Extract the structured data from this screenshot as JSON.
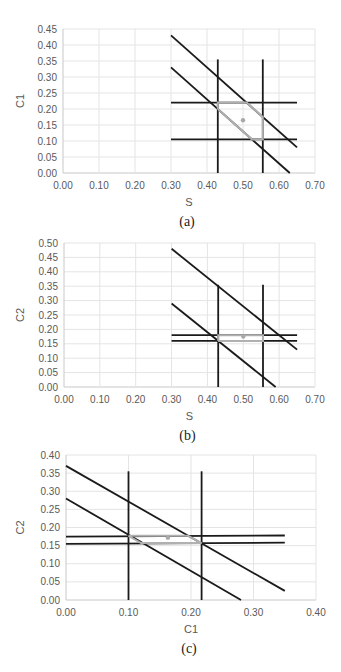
{
  "chart_data": [
    {
      "id": "a",
      "type": "line",
      "caption": "(a)",
      "xlabel": "S",
      "ylabel": "C1",
      "xlim": [
        0,
        0.7
      ],
      "ylim": [
        0,
        0.45
      ],
      "xticks": [
        "0.00",
        "0.10",
        "0.20",
        "0.30",
        "0.40",
        "0.50",
        "0.60",
        "0.70"
      ],
      "yticks": [
        "0.00",
        "0.05",
        "0.10",
        "0.15",
        "0.20",
        "0.25",
        "0.30",
        "0.35",
        "0.40",
        "0.45"
      ],
      "grid": true,
      "series": [
        {
          "name": "upper-diagonal",
          "color": "#1a1a1a",
          "points": [
            [
              0.3,
              0.43
            ],
            [
              0.65,
              0.08
            ]
          ]
        },
        {
          "name": "lower-diagonal",
          "color": "#1a1a1a",
          "points": [
            [
              0.3,
              0.33
            ],
            [
              0.63,
              0.0
            ]
          ]
        },
        {
          "name": "vertical-left",
          "color": "#1a1a1a",
          "points": [
            [
              0.43,
              0.0
            ],
            [
              0.43,
              0.355
            ]
          ]
        },
        {
          "name": "vertical-right",
          "color": "#1a1a1a",
          "points": [
            [
              0.555,
              0.0
            ],
            [
              0.555,
              0.355
            ]
          ]
        },
        {
          "name": "horizontal-top",
          "color": "#1a1a1a",
          "points": [
            [
              0.3,
              0.22
            ],
            [
              0.65,
              0.22
            ]
          ]
        },
        {
          "name": "horizontal-bottom",
          "color": "#1a1a1a",
          "points": [
            [
              0.3,
              0.105
            ],
            [
              0.65,
              0.105
            ]
          ]
        },
        {
          "name": "feasible-region",
          "color": "#b0b0b0",
          "points": [
            [
              0.43,
              0.2
            ],
            [
              0.43,
              0.22
            ],
            [
              0.51,
              0.22
            ],
            [
              0.555,
              0.175
            ],
            [
              0.555,
              0.105
            ],
            [
              0.525,
              0.105
            ],
            [
              0.43,
              0.2
            ]
          ]
        }
      ],
      "marker": {
        "x": 0.5,
        "y": 0.165,
        "color": "#a8a8a8"
      }
    },
    {
      "id": "b",
      "type": "line",
      "caption": "(b)",
      "xlabel": "S",
      "ylabel": "C2",
      "xlim": [
        0,
        0.7
      ],
      "ylim": [
        0,
        0.5
      ],
      "xticks": [
        "0.00",
        "0.10",
        "0.20",
        "0.30",
        "0.40",
        "0.50",
        "0.60",
        "0.70"
      ],
      "yticks": [
        "0.00",
        "0.05",
        "0.10",
        "0.15",
        "0.20",
        "0.25",
        "0.30",
        "0.35",
        "0.40",
        "0.45",
        "0.50"
      ],
      "grid": true,
      "series": [
        {
          "name": "upper-diagonal",
          "color": "#1a1a1a",
          "points": [
            [
              0.3,
              0.48
            ],
            [
              0.65,
              0.13
            ]
          ]
        },
        {
          "name": "lower-diagonal",
          "color": "#1a1a1a",
          "points": [
            [
              0.3,
              0.29
            ],
            [
              0.59,
              0.0
            ]
          ]
        },
        {
          "name": "vertical-left",
          "color": "#1a1a1a",
          "points": [
            [
              0.43,
              0.0
            ],
            [
              0.43,
              0.355
            ]
          ]
        },
        {
          "name": "vertical-right",
          "color": "#1a1a1a",
          "points": [
            [
              0.555,
              0.0
            ],
            [
              0.555,
              0.355
            ]
          ]
        },
        {
          "name": "horizontal-top",
          "color": "#1a1a1a",
          "points": [
            [
              0.3,
              0.18
            ],
            [
              0.65,
              0.18
            ]
          ]
        },
        {
          "name": "horizontal-bottom",
          "color": "#1a1a1a",
          "points": [
            [
              0.3,
              0.16
            ],
            [
              0.65,
              0.16
            ]
          ]
        },
        {
          "name": "feasible-region",
          "color": "#b0b0b0",
          "points": [
            [
              0.43,
              0.16
            ],
            [
              0.43,
              0.18
            ],
            [
              0.555,
              0.18
            ],
            [
              0.555,
              0.16
            ],
            [
              0.43,
              0.16
            ]
          ]
        }
      ],
      "marker": {
        "x": 0.5,
        "y": 0.175,
        "color": "#a8a8a8"
      }
    },
    {
      "id": "c",
      "type": "line",
      "caption": "(c)",
      "xlabel": "C1",
      "ylabel": "C2",
      "xlim": [
        0,
        0.4
      ],
      "ylim": [
        0,
        0.4
      ],
      "xticks": [
        "0.00",
        "0.10",
        "0.20",
        "0.30",
        "0.40"
      ],
      "yticks": [
        "0.00",
        "0.05",
        "0.10",
        "0.15",
        "0.20",
        "0.25",
        "0.30",
        "0.35",
        "0.40"
      ],
      "grid": true,
      "series": [
        {
          "name": "upper-diagonal",
          "color": "#1a1a1a",
          "points": [
            [
              0.0,
              0.37
            ],
            [
              0.35,
              0.025
            ]
          ]
        },
        {
          "name": "lower-diagonal",
          "color": "#1a1a1a",
          "points": [
            [
              0.0,
              0.28
            ],
            [
              0.28,
              0.0
            ]
          ]
        },
        {
          "name": "vertical-left",
          "color": "#1a1a1a",
          "points": [
            [
              0.1,
              0.0
            ],
            [
              0.1,
              0.355
            ]
          ]
        },
        {
          "name": "vertical-right",
          "color": "#1a1a1a",
          "points": [
            [
              0.217,
              0.0
            ],
            [
              0.217,
              0.355
            ]
          ]
        },
        {
          "name": "horizontal-top",
          "color": "#1a1a1a",
          "points": [
            [
              0.0,
              0.175
            ],
            [
              0.35,
              0.178
            ]
          ]
        },
        {
          "name": "horizontal-bottom",
          "color": "#1a1a1a",
          "points": [
            [
              0.0,
              0.155
            ],
            [
              0.35,
              0.158
            ]
          ]
        },
        {
          "name": "feasible-region",
          "color": "#b0b0b0",
          "points": [
            [
              0.1,
              0.177
            ],
            [
              0.195,
              0.177
            ],
            [
              0.217,
              0.157
            ],
            [
              0.12,
              0.157
            ],
            [
              0.1,
              0.177
            ]
          ]
        }
      ],
      "marker": {
        "x": 0.163,
        "y": 0.172,
        "color": "#a8a8a8"
      }
    }
  ],
  "panels": [
    {
      "caption": "(a)",
      "xlabel": "S",
      "ylabel": "C1"
    },
    {
      "caption": "(b)",
      "xlabel": "S",
      "ylabel": "C2"
    },
    {
      "caption": "(c)",
      "xlabel": "C1",
      "ylabel": "C2"
    }
  ]
}
